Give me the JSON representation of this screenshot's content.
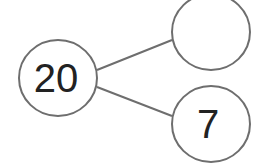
{
  "diagram": {
    "type": "number-bond",
    "whole": {
      "value": "20"
    },
    "parts": [
      {
        "value": ""
      },
      {
        "value": "7"
      }
    ],
    "colors": {
      "stroke": "#6e6e6e",
      "text": "#222222",
      "background": "#ffffff"
    }
  }
}
